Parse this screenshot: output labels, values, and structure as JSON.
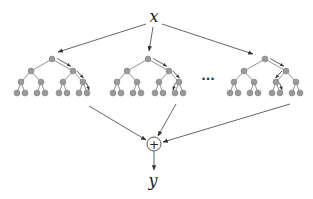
{
  "diagram": {
    "type": "ensemble-of-trees",
    "input_label": "x",
    "output_label": "y",
    "aggregator_symbol": "+",
    "ellipsis": "···",
    "tree_count_shown": 3,
    "tree_depth": 4,
    "colors": {
      "node_fill": "#9a9a9a",
      "node_stroke": "#7a7a7a",
      "edge": "#666666",
      "arrow": "#333333",
      "background": "#ffffff"
    },
    "trees": [
      {
        "name": "tree-1",
        "root_x": 52,
        "highlight_path": [
          "R",
          "R",
          "R"
        ]
      },
      {
        "name": "tree-2",
        "root_x": 148,
        "highlight_path": [
          "R",
          "R",
          "L"
        ]
      },
      {
        "name": "tree-3",
        "root_x": 265,
        "highlight_path": [
          "R",
          "L",
          "R"
        ]
      }
    ]
  }
}
